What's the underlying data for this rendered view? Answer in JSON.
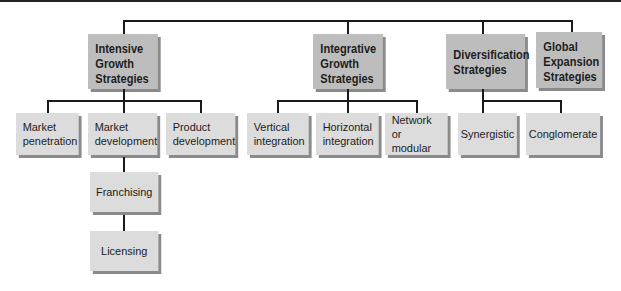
{
  "diagram": {
    "level1": [
      {
        "id": "intensive",
        "label": "Intensive\nGrowth\nStrategies"
      },
      {
        "id": "integrative",
        "label": "Integrative\nGrowth\nStrategies"
      },
      {
        "id": "diversification",
        "label": "Diversification\nStrategies"
      },
      {
        "id": "global",
        "label": "Global\nExpansion\nStrategies"
      }
    ],
    "level2": {
      "intensive": [
        {
          "label": "Market\npenetration"
        },
        {
          "label": "Market\ndevelopment"
        },
        {
          "label": "Product\ndevelopment"
        }
      ],
      "integrative": [
        {
          "label": "Vertical\nintegration"
        },
        {
          "label": "Horizontal\nintegration"
        },
        {
          "label": "Network\nor modular"
        }
      ],
      "diversification": [
        {
          "label": "Synergistic"
        },
        {
          "label": "Conglomerate"
        }
      ]
    },
    "level3": {
      "market_development": [
        {
          "label": "Franchising"
        },
        {
          "label": "Licensing"
        }
      ]
    },
    "colors": {
      "level1_fill": "#bdbdbd",
      "level2_fill": "#dcdcdc",
      "shadow": "#8a8a8a",
      "connector": "#1a1a1a"
    }
  }
}
